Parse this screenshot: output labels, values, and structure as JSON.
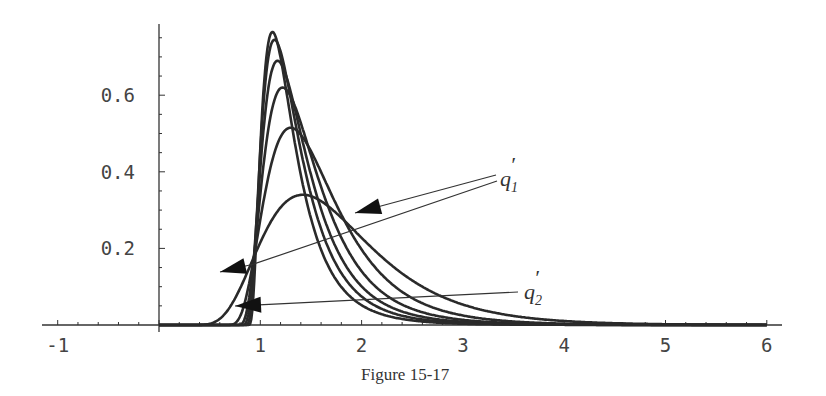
{
  "figure": {
    "caption": "Figure 15-17"
  },
  "chart_data": {
    "type": "line",
    "title": "",
    "caption": "Figure 15-17",
    "xlabel": "",
    "ylabel": "",
    "xlim": [
      -1.2,
      6.1
    ],
    "ylim": [
      0,
      0.79
    ],
    "grid": false,
    "x_ticks": [
      -1,
      1,
      2,
      3,
      4,
      5,
      6
    ],
    "x_tick_labels": [
      "-1",
      "1",
      "2",
      "3",
      "4",
      "5",
      "6"
    ],
    "y_ticks": [
      0.2,
      0.4,
      0.6
    ],
    "y_tick_labels": [
      "0.2",
      "0.4",
      "0.6"
    ],
    "annotations": [
      {
        "label": "q",
        "sub": "1",
        "prime": "′",
        "text": "q₁′",
        "arrow_targets": [
          [
            0.6,
            0.155
          ],
          [
            1.95,
            0.31
          ]
        ]
      },
      {
        "label": "q",
        "sub": "2",
        "prime": "′",
        "text": "q₂′",
        "arrow_targets": [
          [
            0.75,
            0.055
          ]
        ]
      }
    ],
    "series": [
      {
        "name": "curve-1",
        "start": 0.15,
        "peak_x": 1.42,
        "peak_y": 0.34,
        "sigma": 0.42
      },
      {
        "name": "curve-2",
        "start": 0.6,
        "peak_x": 1.3,
        "peak_y": 0.515,
        "sigma": 0.5
      },
      {
        "name": "curve-3",
        "start": 0.74,
        "peak_x": 1.22,
        "peak_y": 0.62,
        "sigma": 0.56
      },
      {
        "name": "curve-4",
        "start": 0.8,
        "peak_x": 1.17,
        "peak_y": 0.69,
        "sigma": 0.6
      },
      {
        "name": "curve-5",
        "start": 0.84,
        "peak_x": 1.14,
        "peak_y": 0.745,
        "sigma": 0.63
      },
      {
        "name": "curve-6",
        "start": 0.87,
        "peak_x": 1.12,
        "peak_y": 0.765,
        "sigma": 0.65
      }
    ]
  }
}
